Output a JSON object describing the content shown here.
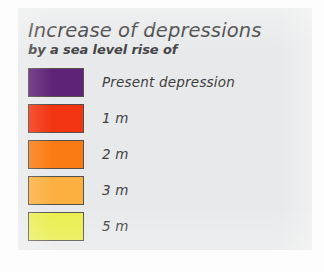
{
  "legend": {
    "title": "Increase of depressions",
    "subtitle": "by a sea level rise of",
    "entries": [
      {
        "label": "Present depression",
        "color": "#5E2276",
        "swatch_name": "swatch-present-depression"
      },
      {
        "label": "1 m",
        "color": "#F23411",
        "swatch_name": "swatch-1m"
      },
      {
        "label": "2 m",
        "color": "#F97B13",
        "swatch_name": "swatch-2m"
      },
      {
        "label": "3 m",
        "color": "#FBB040",
        "swatch_name": "swatch-3m"
      },
      {
        "label": "5 m",
        "color": "#E8EE4A",
        "swatch_name": "swatch-5m"
      }
    ]
  },
  "colors": {
    "panel_background": "#E8E9EA",
    "page_background": "#FDFDFD",
    "title_text": "#3B3B3D",
    "label_text": "#3F3F41",
    "swatch_border": "#55504B"
  }
}
